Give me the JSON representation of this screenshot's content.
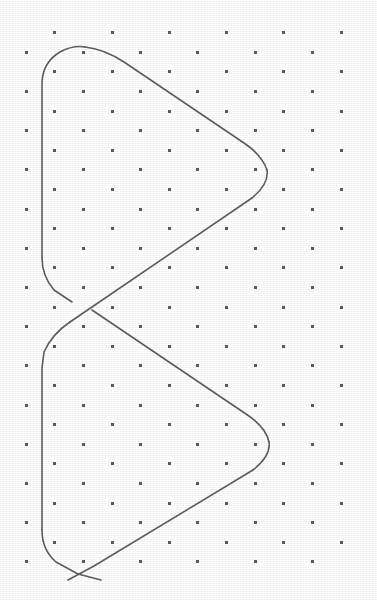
{
  "canvas": {
    "width": 377,
    "height": 600,
    "background_color": "#ffffff",
    "description": "Scanned line drawing: a single continuous closed path forming two stacked triangular lobes (a vertical bowtie / figure-eight) over a staggered dot grid."
  },
  "grid": {
    "name": "staggered-dot-grid",
    "dot_color": "#5c5c5c",
    "dot_size_px": 3,
    "column_spacing_px": 57.3,
    "row_spacing_px": 19.6,
    "row_offset_px": 28.65,
    "first_row_y": 32.7,
    "even_row_first_x": 54.7,
    "odd_row_first_x": 26.0,
    "columns_per_row": 6,
    "rows": 28
  },
  "path": {
    "name": "bowtie-path",
    "stroke_color": "#5f5f5f",
    "stroke_width_px": 1.6,
    "closed": false,
    "vertices": {
      "upper_apex": [
        84,
        47
      ],
      "upper_right_vertex": [
        267,
        170
      ],
      "upper_left_top": [
        42,
        72
      ],
      "upper_left_bottom": [
        42,
        257
      ],
      "center_crossing": [
        90,
        308
      ],
      "lower_left_top": [
        42,
        355
      ],
      "lower_right_vertex": [
        269,
        442
      ],
      "lower_left_bottom": [
        42,
        530
      ],
      "bottom_crossing": [
        84,
        568
      ],
      "tail_left_end": [
        68,
        580
      ],
      "tail_right_end": [
        101,
        580
      ]
    },
    "segments": [
      {
        "name": "upper-lobe-top-edge",
        "from": "upper_apex",
        "to": "upper_right_vertex"
      },
      {
        "name": "upper-lobe-right-cusp",
        "at": "upper_right_vertex"
      },
      {
        "name": "upper-lobe-diagonal-to-center",
        "from": "upper_right_vertex",
        "to": "center_crossing"
      },
      {
        "name": "upper-lobe-left-edge",
        "from": "upper_left_bottom",
        "to": "upper_left_top"
      },
      {
        "name": "lower-lobe-top-edge",
        "from": "center_crossing",
        "to": "lower_right_vertex"
      },
      {
        "name": "lower-lobe-right-cusp",
        "at": "lower_right_vertex"
      },
      {
        "name": "lower-lobe-diagonal-to-bottom",
        "from": "lower_right_vertex",
        "to": "bottom_crossing"
      },
      {
        "name": "lower-lobe-left-edge",
        "from": "lower_left_top",
        "to": "lower_left_bottom"
      }
    ]
  },
  "chart_data": {
    "type": "line",
    "title": "",
    "xlabel": "",
    "ylabel": "",
    "grid": true,
    "legend_position": "none",
    "xlim": [
      0,
      377
    ],
    "ylim": [
      600,
      0
    ],
    "series": [
      {
        "name": "upper-lobe",
        "x": [
          84,
          42,
          42,
          90,
          267,
          210,
          120,
          84
        ],
        "y": [
          47,
          72,
          257,
          308,
          170,
          123,
          60,
          47
        ]
      },
      {
        "name": "lower-lobe",
        "x": [
          90,
          42,
          42,
          84,
          269,
          205,
          130,
          90
        ],
        "y": [
          308,
          355,
          530,
          568,
          442,
          390,
          335,
          308
        ]
      },
      {
        "name": "crossing-tails",
        "x": [
          68,
          101
        ],
        "y": [
          580,
          580
        ]
      }
    ]
  }
}
